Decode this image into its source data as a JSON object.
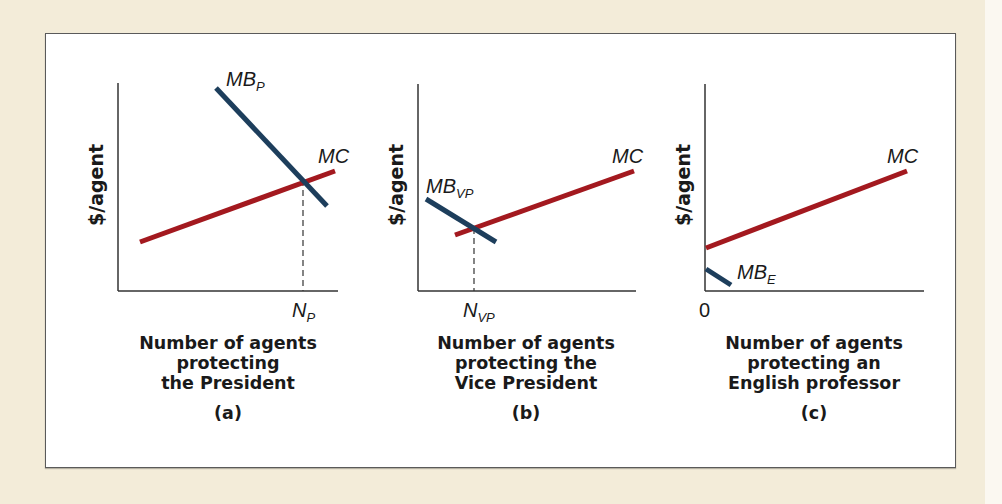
{
  "colors": {
    "background": "#f3ecd9",
    "panel": "#ffffff",
    "mc_line": "#a3191f",
    "mb_line": "#1d3e5c",
    "axis": "#333333"
  },
  "panels": [
    {
      "id": "a",
      "y_axis_label": "$/agent",
      "mb_label_main": "MB",
      "mb_label_sub": "P",
      "mc_label": "MC",
      "x_marker_main": "N",
      "x_marker_sub": "P",
      "caption_lines": [
        "Number of agents",
        "protecting",
        "the President"
      ],
      "letter": "(a)"
    },
    {
      "id": "b",
      "y_axis_label": "$/agent",
      "mb_label_main": "MB",
      "mb_label_sub": "VP",
      "mc_label": "MC",
      "x_marker_main": "N",
      "x_marker_sub": "VP",
      "caption_lines": [
        "Number of agents",
        "protecting the",
        "Vice President"
      ],
      "letter": "(b)"
    },
    {
      "id": "c",
      "y_axis_label": "$/agent",
      "mb_label_main": "MB",
      "mb_label_sub": "E",
      "mc_label": "MC",
      "x_marker_main": "0",
      "x_marker_sub": "",
      "caption_lines": [
        "Number of agents",
        "protecting an",
        "English professor"
      ],
      "letter": "(c)"
    }
  ]
}
